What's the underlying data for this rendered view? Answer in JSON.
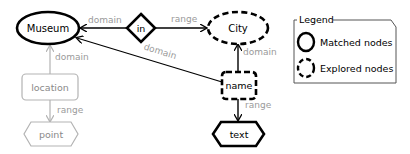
{
  "nodes": {
    "museum": {
      "label": "Museum",
      "type": "matched"
    },
    "in": {
      "label": "in",
      "type": "matched"
    },
    "city": {
      "label": "City",
      "type": "explored"
    },
    "location": {
      "label": "location",
      "type": "unexplored"
    },
    "point": {
      "label": "point",
      "type": "unexplored"
    },
    "name": {
      "label": "name",
      "type": "explored"
    },
    "text": {
      "label": "text",
      "type": "matched"
    }
  },
  "edges": {
    "in_museum": {
      "label": "domain",
      "from": "in",
      "to": "Museum"
    },
    "in_city": {
      "label": "range",
      "from": "in",
      "to": "City"
    },
    "location_museum": {
      "label": "domain",
      "from": "location",
      "to": "Museum"
    },
    "location_point": {
      "label": "range",
      "from": "location",
      "to": "point"
    },
    "name_museum": {
      "label": "domain",
      "from": "name",
      "to": "Museum"
    },
    "name_city": {
      "label": "domain",
      "from": "name",
      "to": "City"
    },
    "name_text": {
      "label": "range",
      "from": "name",
      "to": "text"
    }
  },
  "legend": {
    "title": "Legend",
    "items": [
      {
        "label": "Matched nodes",
        "style": "solid"
      },
      {
        "label": "Explored nodes",
        "style": "dashed"
      }
    ]
  },
  "colors": {
    "dark": "#000000",
    "faded": "#b3b3b3",
    "edge_label": "#9a9a9a"
  }
}
